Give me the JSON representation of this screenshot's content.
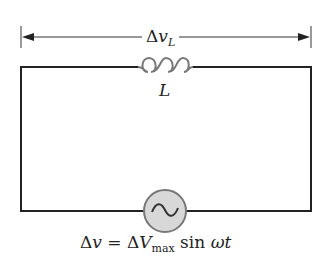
{
  "diagram": {
    "type": "circuit",
    "title": "",
    "voltage_label": {
      "delta": "Δ",
      "symbol": "v",
      "subscript": "L"
    },
    "inductor": {
      "label": "L",
      "color": "#777777"
    },
    "source": {
      "type": "AC",
      "glyph": "~",
      "fill": "#d8d8d8",
      "stroke": "#777777"
    },
    "equation": {
      "lhs_delta": "Δ",
      "lhs_var": "v",
      "equals": " = ",
      "rhs_delta": "Δ",
      "rhs_var": "V",
      "rhs_sub": "max",
      "func": " sin ",
      "arg": "ωt"
    },
    "wire_color": "#222222"
  }
}
